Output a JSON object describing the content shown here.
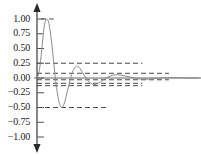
{
  "chart_data": {
    "type": "line",
    "title": "",
    "subtitle": "",
    "xlabel": "",
    "ylabel": "",
    "grid": false,
    "legend": null,
    "legend_position": "none",
    "xlim": [
      0,
      14
    ],
    "ylim": [
      -1.125,
      1.125
    ],
    "yticks": [
      1.0,
      0.75,
      0.5,
      0.25,
      0.0,
      -0.25,
      -0.5,
      -0.75,
      -1.0
    ],
    "ytick_labels": [
      "1.00",
      "0.75",
      "0.50",
      "0.25",
      "0.00",
      "−0.25",
      "−0.50",
      "−0.75",
      "−1.00"
    ],
    "xticks": [],
    "xtick_labels": [],
    "axis_style": {
      "y_axis_arrow_top": true,
      "y_axis_arrow_bottom": true,
      "x_axis_line": true,
      "x_axis_arrow": false,
      "spine_color": "#555555",
      "tick_side": "right"
    },
    "series": [
      {
        "name": "damped-oscillation",
        "style": "solid",
        "color": "#8a8a8a",
        "description": "decaying sinusoid, amplitude halves each half-cycle",
        "x": [
          0.0,
          0.12,
          0.25,
          0.37,
          0.5,
          0.62,
          0.75,
          0.87,
          1.0,
          1.12,
          1.25,
          1.37,
          1.5,
          1.62,
          1.75,
          1.87,
          2.0,
          2.12,
          2.25,
          2.37,
          2.5,
          2.62,
          2.75,
          2.87,
          3.0,
          3.12,
          3.25,
          3.37,
          3.5,
          3.62,
          3.75,
          3.87,
          4.0,
          4.25,
          4.5,
          4.75,
          5.0,
          5.25,
          5.5,
          5.75,
          6.0,
          6.5,
          7.0,
          7.5,
          8.0,
          8.5,
          9.0,
          9.5,
          10.0,
          11.0,
          12.0,
          13.0,
          14.0
        ],
        "y": [
          0.0,
          0.05,
          0.191,
          0.407,
          0.655,
          0.866,
          0.981,
          1.0,
          0.95,
          0.82,
          0.625,
          0.4,
          0.16,
          -0.06,
          -0.24,
          -0.38,
          -0.47,
          -0.5,
          -0.48,
          -0.42,
          -0.33,
          -0.23,
          -0.12,
          -0.02,
          0.06,
          0.125,
          0.17,
          0.195,
          0.2,
          0.185,
          0.155,
          0.115,
          0.07,
          -0.01,
          -0.07,
          -0.1,
          -0.11,
          -0.095,
          -0.065,
          -0.03,
          0.005,
          0.045,
          0.055,
          0.04,
          0.018,
          -0.005,
          -0.018,
          -0.02,
          -0.012,
          0.004,
          0.006,
          0.002,
          0.0
        ]
      }
    ],
    "reference_lines": [
      {
        "name": "level-1.00",
        "value": 1.0,
        "style": "dashed",
        "x_start": 0.35,
        "x_end": 1.45,
        "color": "#4a4a4a"
      },
      {
        "name": "level-0.25",
        "value": 0.25,
        "style": "dashed",
        "x_start": 0.0,
        "x_end": 9.1,
        "color": "#4a4a4a"
      },
      {
        "name": "level-0.08",
        "value": 0.08,
        "style": "dashed",
        "x_start": 0.0,
        "x_end": 11.4,
        "color": "#4a4a4a"
      },
      {
        "name": "level--0.03",
        "value": -0.03,
        "style": "dashed",
        "x_start": 0.0,
        "x_end": 11.4,
        "color": "#4a4a4a"
      },
      {
        "name": "level--0.09",
        "value": -0.09,
        "style": "dashed",
        "x_start": 0.0,
        "x_end": 9.1,
        "color": "#4a4a4a"
      },
      {
        "name": "level--0.13",
        "value": -0.13,
        "style": "dashed",
        "x_start": 0.0,
        "x_end": 9.1,
        "color": "#4a4a4a"
      },
      {
        "name": "level--0.50",
        "value": -0.5,
        "style": "dashed",
        "x_start": 0.0,
        "x_end": 6.1,
        "color": "#4a4a4a"
      }
    ],
    "colors": {
      "curve": "#8a8a8a",
      "dashed": "#4a4a4a",
      "axis": "#555555",
      "text": "#1a1a1a",
      "background": "#ffffff"
    }
  }
}
